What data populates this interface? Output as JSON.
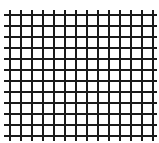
{
  "grid": {
    "line_color": "#1a1a1a",
    "background": "#ffffff",
    "line_width": 2,
    "vertical_lines": [
      9,
      20,
      31,
      42,
      53,
      64,
      75,
      86,
      97,
      108,
      119,
      130,
      141,
      152
    ],
    "horizontal_lines": [
      14,
      25,
      36,
      47,
      58,
      69,
      80,
      91,
      102,
      113,
      124,
      135
    ],
    "vertical_extent": [
      10,
      141
    ],
    "horizontal_extent": [
      4,
      157
    ]
  }
}
